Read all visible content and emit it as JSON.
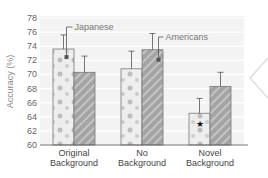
{
  "chart_data": {
    "type": "bar",
    "title": "",
    "xlabel": "",
    "ylabel": "Accuracy (%)",
    "ylim": [
      60,
      78
    ],
    "yticks": [
      60,
      62,
      64,
      66,
      68,
      70,
      72,
      74,
      76,
      78
    ],
    "grid": true,
    "categories": [
      "Original Background",
      "No Background",
      "Novel Background"
    ],
    "category_lines": [
      [
        "Original",
        "Background"
      ],
      [
        "No",
        "Background"
      ],
      [
        "Novel",
        "Background"
      ]
    ],
    "series": [
      {
        "name": "Japanese",
        "values": [
          73.6,
          70.8,
          64.5
        ],
        "errors": [
          2.0,
          2.5,
          2.1
        ],
        "color": "#e9e9e9"
      },
      {
        "name": "Americans",
        "values": [
          70.3,
          73.5,
          68.3
        ],
        "errors": [
          2.3,
          2.3,
          2.0
        ],
        "color": "#9a9a9a"
      }
    ],
    "annotations": [
      {
        "text": "★",
        "category": "Novel Background",
        "series": "Japanese"
      }
    ],
    "legend": {
      "position": "inline-callouts"
    }
  }
}
